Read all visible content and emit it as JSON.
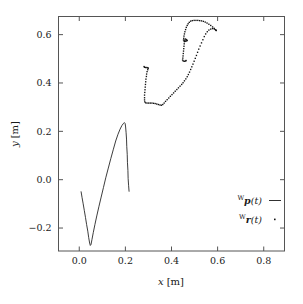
{
  "chart_data": {
    "type": "scatter",
    "title": "",
    "xlabel": "x [m]",
    "ylabel": "y [m]",
    "xlim": [
      -0.09,
      0.89
    ],
    "ylim": [
      -0.295,
      0.675
    ],
    "grid": false,
    "legend_position": "bottom-right",
    "xticks": [
      0.0,
      0.2,
      0.4,
      0.6,
      0.8
    ],
    "xticklabels": [
      "0.0",
      "0.2",
      "0.4",
      "0.6",
      "0.8"
    ],
    "yticks": [
      -0.2,
      0.0,
      0.2,
      0.4,
      0.6
    ],
    "yticklabels": [
      "−0.2",
      "0.0",
      "0.2",
      "0.4",
      "0.6"
    ],
    "series": [
      {
        "name": "Wp(t)",
        "label_prefix": "W",
        "label_symbol": "p",
        "label_arg": "(t)",
        "style": "line",
        "marker": "—",
        "color": "#1a1a1a",
        "points": [
          [
            0.008,
            -0.05
          ],
          [
            0.012,
            -0.073
          ],
          [
            0.017,
            -0.1
          ],
          [
            0.022,
            -0.128
          ],
          [
            0.027,
            -0.156
          ],
          [
            0.032,
            -0.186
          ],
          [
            0.037,
            -0.213
          ],
          [
            0.041,
            -0.24
          ],
          [
            0.045,
            -0.262
          ],
          [
            0.048,
            -0.272
          ],
          [
            0.051,
            -0.268
          ],
          [
            0.055,
            -0.248
          ],
          [
            0.061,
            -0.218
          ],
          [
            0.068,
            -0.185
          ],
          [
            0.076,
            -0.15
          ],
          [
            0.085,
            -0.112
          ],
          [
            0.095,
            -0.072
          ],
          [
            0.105,
            -0.032
          ],
          [
            0.115,
            0.008
          ],
          [
            0.126,
            0.048
          ],
          [
            0.137,
            0.088
          ],
          [
            0.148,
            0.126
          ],
          [
            0.158,
            0.16
          ],
          [
            0.168,
            0.188
          ],
          [
            0.177,
            0.209
          ],
          [
            0.185,
            0.224
          ],
          [
            0.192,
            0.233
          ],
          [
            0.196,
            0.236
          ],
          [
            0.199,
            0.232
          ],
          [
            0.201,
            0.218
          ],
          [
            0.203,
            0.196
          ],
          [
            0.205,
            0.168
          ],
          [
            0.206,
            0.138
          ],
          [
            0.208,
            0.105
          ],
          [
            0.209,
            0.072
          ],
          [
            0.211,
            0.038
          ],
          [
            0.212,
            0.005
          ],
          [
            0.214,
            -0.025
          ],
          [
            0.216,
            -0.048
          ]
        ]
      },
      {
        "name": "Wr(t)",
        "label_prefix": "W",
        "label_symbol": "r",
        "label_arg": "(t)",
        "style": "dots",
        "marker": "·",
        "color": "#111111",
        "points": [
          [
            0.281,
            0.468
          ],
          [
            0.283,
            0.465
          ],
          [
            0.288,
            0.464
          ],
          [
            0.293,
            0.464
          ],
          [
            0.297,
            0.463
          ],
          [
            0.299,
            0.461
          ],
          [
            0.297,
            0.455
          ],
          [
            0.294,
            0.447
          ],
          [
            0.292,
            0.437
          ],
          [
            0.291,
            0.427
          ],
          [
            0.289,
            0.416
          ],
          [
            0.288,
            0.405
          ],
          [
            0.287,
            0.394
          ],
          [
            0.286,
            0.383
          ],
          [
            0.285,
            0.372
          ],
          [
            0.284,
            0.361
          ],
          [
            0.283,
            0.35
          ],
          [
            0.283,
            0.339
          ],
          [
            0.283,
            0.33
          ],
          [
            0.284,
            0.322
          ],
          [
            0.288,
            0.318
          ],
          [
            0.294,
            0.317
          ],
          [
            0.301,
            0.317
          ],
          [
            0.308,
            0.317
          ],
          [
            0.315,
            0.317
          ],
          [
            0.322,
            0.316
          ],
          [
            0.329,
            0.315
          ],
          [
            0.336,
            0.313
          ],
          [
            0.343,
            0.311
          ],
          [
            0.35,
            0.309
          ],
          [
            0.356,
            0.308
          ],
          [
            0.362,
            0.311
          ],
          [
            0.368,
            0.317
          ],
          [
            0.374,
            0.324
          ],
          [
            0.381,
            0.331
          ],
          [
            0.388,
            0.338
          ],
          [
            0.395,
            0.345
          ],
          [
            0.402,
            0.352
          ],
          [
            0.409,
            0.359
          ],
          [
            0.416,
            0.366
          ],
          [
            0.423,
            0.373
          ],
          [
            0.43,
            0.38
          ],
          [
            0.437,
            0.387
          ],
          [
            0.444,
            0.394
          ],
          [
            0.45,
            0.401
          ],
          [
            0.456,
            0.409
          ],
          [
            0.462,
            0.417
          ],
          [
            0.468,
            0.426
          ],
          [
            0.473,
            0.435
          ],
          [
            0.478,
            0.445
          ],
          [
            0.483,
            0.456
          ],
          [
            0.488,
            0.467
          ],
          [
            0.493,
            0.478
          ],
          [
            0.498,
            0.49
          ],
          [
            0.503,
            0.502
          ],
          [
            0.508,
            0.514
          ],
          [
            0.513,
            0.527
          ],
          [
            0.518,
            0.54
          ],
          [
            0.524,
            0.553
          ],
          [
            0.53,
            0.566
          ],
          [
            0.536,
            0.579
          ],
          [
            0.542,
            0.592
          ],
          [
            0.548,
            0.603
          ],
          [
            0.555,
            0.612
          ],
          [
            0.562,
            0.619
          ],
          [
            0.57,
            0.623
          ],
          [
            0.578,
            0.625
          ],
          [
            0.586,
            0.623
          ],
          [
            0.592,
            0.619
          ],
          [
            0.594,
            0.617
          ],
          [
            0.591,
            0.62
          ],
          [
            0.585,
            0.626
          ],
          [
            0.578,
            0.632
          ],
          [
            0.57,
            0.638
          ],
          [
            0.562,
            0.643
          ],
          [
            0.554,
            0.648
          ],
          [
            0.546,
            0.652
          ],
          [
            0.538,
            0.655
          ],
          [
            0.53,
            0.657
          ],
          [
            0.522,
            0.658
          ],
          [
            0.514,
            0.659
          ],
          [
            0.506,
            0.659
          ],
          [
            0.498,
            0.659
          ],
          [
            0.49,
            0.658
          ],
          [
            0.483,
            0.656
          ],
          [
            0.477,
            0.651
          ],
          [
            0.472,
            0.645
          ],
          [
            0.468,
            0.638
          ],
          [
            0.464,
            0.63
          ],
          [
            0.461,
            0.621
          ],
          [
            0.458,
            0.612
          ],
          [
            0.456,
            0.603
          ],
          [
            0.454,
            0.594
          ],
          [
            0.453,
            0.585
          ],
          [
            0.452,
            0.578
          ],
          [
            0.455,
            0.574
          ],
          [
            0.46,
            0.573
          ],
          [
            0.465,
            0.574
          ],
          [
            0.468,
            0.576
          ],
          [
            0.465,
            0.579
          ],
          [
            0.461,
            0.582
          ],
          [
            0.458,
            0.578
          ],
          [
            0.456,
            0.571
          ],
          [
            0.455,
            0.562
          ],
          [
            0.454,
            0.552
          ],
          [
            0.453,
            0.542
          ],
          [
            0.452,
            0.532
          ],
          [
            0.451,
            0.522
          ],
          [
            0.45,
            0.512
          ],
          [
            0.449,
            0.503
          ],
          [
            0.448,
            0.495
          ],
          [
            0.451,
            0.491
          ],
          [
            0.456,
            0.49
          ],
          [
            0.461,
            0.491
          ],
          [
            0.463,
            0.493
          ]
        ]
      }
    ]
  },
  "legend": {
    "entries": [
      {
        "prefix": "W",
        "symbol": "p",
        "arg": "(t)",
        "marker": "line"
      },
      {
        "prefix": "W",
        "symbol": "r",
        "arg": "(t)",
        "marker": "dot"
      }
    ]
  },
  "axes": {
    "x_label_var": "x",
    "x_label_unit": "[m]",
    "y_label_var": "y",
    "y_label_unit": "[m]"
  }
}
